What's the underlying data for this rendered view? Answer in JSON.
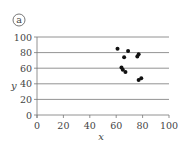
{
  "panel_label": "a",
  "chart_data": {
    "type": "scatter",
    "title": "",
    "panel_label": "a",
    "xlabel": "x",
    "ylabel": "y",
    "xlim": [
      0,
      100
    ],
    "ylim": [
      0,
      100
    ],
    "x_ticks": [
      0,
      20,
      40,
      60,
      80,
      100
    ],
    "y_ticks": [
      0,
      20,
      40,
      60,
      80,
      100
    ],
    "grid": "horizontal",
    "legend": null,
    "points": [
      {
        "x": 61,
        "y": 85
      },
      {
        "x": 69,
        "y": 82
      },
      {
        "x": 66,
        "y": 74
      },
      {
        "x": 77,
        "y": 78
      },
      {
        "x": 76,
        "y": 75
      },
      {
        "x": 64,
        "y": 61
      },
      {
        "x": 65,
        "y": 58
      },
      {
        "x": 67,
        "y": 55
      },
      {
        "x": 77,
        "y": 45
      },
      {
        "x": 79,
        "y": 47
      }
    ]
  }
}
